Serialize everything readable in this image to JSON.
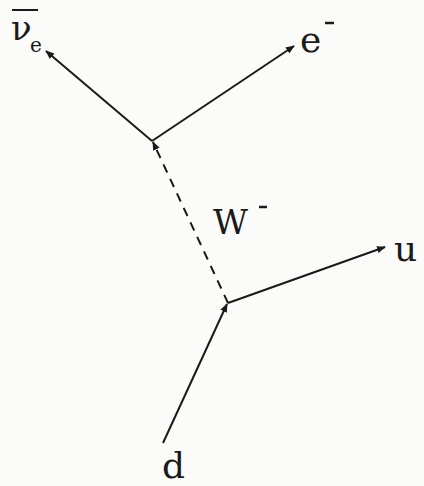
{
  "diagram": {
    "type": "feynman",
    "process": "beta-minus decay",
    "colors": {
      "background": "#fbfbfa",
      "line": "#1a1a1a"
    },
    "vertices": [
      {
        "id": "lepton-vertex",
        "x": 152,
        "y": 141
      },
      {
        "id": "quark-vertex",
        "x": 228,
        "y": 303
      }
    ],
    "particles": {
      "antineutrino": {
        "symbol": "ν",
        "subscript": "e",
        "bar": true,
        "label": "ν̄e"
      },
      "electron": {
        "symbol": "e",
        "superscript": "-",
        "label": "e⁻"
      },
      "w_boson": {
        "symbol": "W",
        "superscript": "-",
        "label": "W⁻",
        "line_style": "dashed"
      },
      "up_quark": {
        "symbol": "u",
        "label": "u"
      },
      "down_quark": {
        "symbol": "d",
        "label": "d"
      }
    }
  }
}
